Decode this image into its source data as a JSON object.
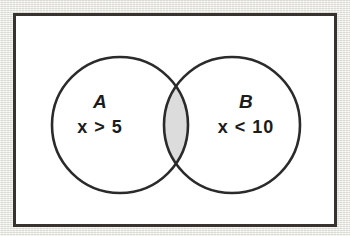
{
  "diagram": {
    "type": "venn-diagram",
    "title": "",
    "frame": {
      "border_color": "#38332f",
      "interior_color": "#ffffff",
      "page_background_color": "#e9e9e3"
    },
    "stroke_color": "#2b2b2b",
    "intersection": {
      "shaded": true,
      "fill_color": "#dcdcdc",
      "label": ""
    },
    "sets": [
      {
        "id": "set-a",
        "name": "A",
        "condition": "x > 5",
        "position": "left",
        "fill_color": "#ffffff"
      },
      {
        "id": "set-b",
        "name": "B",
        "condition": "x < 10",
        "position": "right",
        "fill_color": "#ffffff"
      }
    ]
  }
}
